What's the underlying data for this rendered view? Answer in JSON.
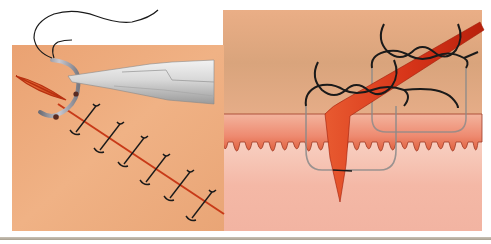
{
  "figure": {
    "colors": {
      "page_background": "#ffffff",
      "skin_tan": "#e8a070",
      "skin_tan_light": "#f0b488",
      "dermis_tan": "#dba57a",
      "papillary_pink": "#f0a08a",
      "papillary_dark": "#c8503a",
      "subcutis_pink": "#f6c0b0",
      "incision_red": "#d8401e",
      "incision_dark": "#b8220e",
      "suture_black": "#1a1a1a",
      "suture_gray": "#8a8a8a",
      "instrument_light": "#e4e4e4",
      "instrument_mid": "#bcbcbc",
      "instrument_dark": "#8e8e8e",
      "bottom_rule": "#b0a798"
    },
    "panels": [
      {
        "id": "left",
        "label": "Surface view of sutured incision with needle holder and curved needle",
        "stitch_count": 7,
        "elements": [
          "skin-surface",
          "incision-line",
          "needle-holder",
          "curved-needle",
          "suture-thread",
          "interrupted-stitches"
        ]
      },
      {
        "id": "right",
        "label": "Cross-sectional view of skin layers with suture loops tied over incision",
        "suture_loop_count": 2,
        "elements": [
          "dermis-layer",
          "papillary-layer",
          "subcutaneous-layer",
          "incision-wedge",
          "suture-loops",
          "suture-knots"
        ]
      }
    ]
  }
}
